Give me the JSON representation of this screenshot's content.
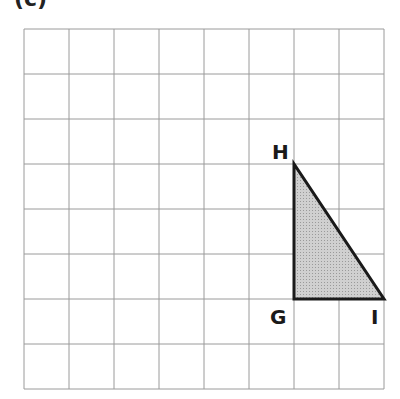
{
  "part_label": "(c)",
  "grid": {
    "cols": 8,
    "rows": 8,
    "left": 24,
    "top": 29,
    "cell": 45,
    "line_color": "#9a9a9a"
  },
  "triangle": {
    "fill": "#c8c8c8",
    "stroke": "#1a1a1a",
    "vertices": [
      {
        "name": "H",
        "col": 6,
        "row": 3
      },
      {
        "name": "G",
        "col": 6,
        "row": 6
      },
      {
        "name": "I",
        "col": 8,
        "row": 6
      }
    ]
  },
  "labels": {
    "H": "H",
    "G": "G",
    "I": "I"
  }
}
